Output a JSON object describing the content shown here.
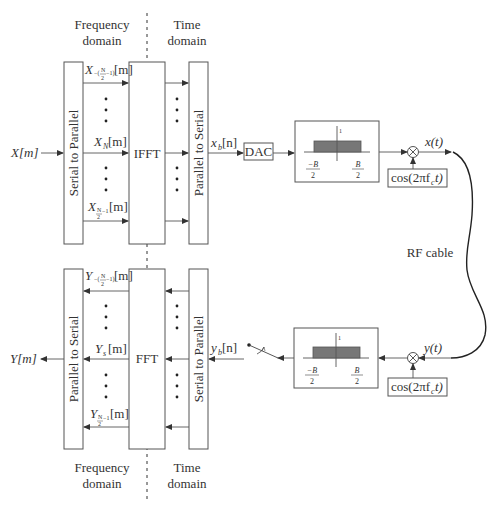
{
  "diagram": {
    "domains": {
      "top": {
        "frequency": [
          "Frequency",
          "domain"
        ],
        "time": [
          "Time",
          "domain"
        ]
      },
      "bottom": {
        "frequency": [
          "Frequency",
          "domain"
        ],
        "time": [
          "Time",
          "domain"
        ]
      }
    },
    "transmitter": {
      "input": "X[m]",
      "serial_to_parallel": "Serial to Parallel",
      "ifft": "IFFT",
      "parallel_to_serial": "Parallel to Serial",
      "subcarrier_labels": {
        "top": {
          "base": "X",
          "sub": "−(N/2−1)",
          "suffix": "[m]"
        },
        "middle": {
          "base": "X",
          "sub": "N",
          "suffix": "[m]"
        },
        "bottom": {
          "base": "X",
          "sub": "N/2−1",
          "suffix": "[m]"
        }
      },
      "baseband_output": "x_b[n]",
      "baseband_base": "x",
      "baseband_sub": "b",
      "baseband_suffix": "[n]",
      "dac": "DAC",
      "filter": {
        "peak": "1",
        "left": "−B",
        "right": "B",
        "denominator": "2"
      },
      "mixer_input": "cos(2πf_c t)",
      "carrier_label": "cos(2πf",
      "carrier_sub": "c",
      "carrier_tail": "t)",
      "output": "x(t)"
    },
    "channel": {
      "label": "RF cable"
    },
    "receiver": {
      "input": "y(t)",
      "carrier_label": "cos(2πf",
      "carrier_sub": "c",
      "carrier_tail": "t)",
      "filter": {
        "peak": "1",
        "left": "−B",
        "right": "B",
        "denominator": "2"
      },
      "sampler": "switch",
      "baseband_input": "y_b[n]",
      "baseband_base": "y",
      "baseband_sub": "b",
      "baseband_suffix": "[n]",
      "serial_to_parallel": "Serial to Parallel",
      "fft": "FFT",
      "parallel_to_serial": "Parallel to Serial",
      "subcarrier_labels": {
        "top": {
          "base": "Y",
          "sub": "−(N/2−1)",
          "suffix": "[m]"
        },
        "middle": {
          "base": "Y",
          "sub": "s",
          "suffix": "[m]"
        },
        "bottom": {
          "base": "Y",
          "sub": "N/2−1",
          "suffix": "[m]"
        }
      },
      "output": "Y[m]"
    }
  }
}
